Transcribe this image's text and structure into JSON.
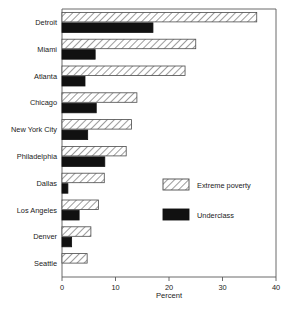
{
  "chart_data": {
    "type": "bar",
    "orientation": "horizontal",
    "title": "",
    "xlabel": "Percent",
    "ylabel": "",
    "xlim": [
      0,
      40
    ],
    "xticks": [
      0,
      10,
      20,
      30,
      40
    ],
    "xtick_labels": [
      "0",
      "10",
      "20",
      "30",
      "40"
    ],
    "grid": false,
    "legend_position": "center-right",
    "categories": [
      "Detroit",
      "Miami",
      "Atlanta",
      "Chicago",
      "New York City",
      "Philadelphia",
      "Dallas",
      "Los Angeles",
      "Denver",
      "Seattle"
    ],
    "series": [
      {
        "name": "Extreme poverty",
        "pattern": "diagonal-hatch",
        "color": "#ffffff",
        "values": [
          36.4,
          25.0,
          23.0,
          14.0,
          13.0,
          12.0,
          7.9,
          6.8,
          5.4,
          4.7
        ]
      },
      {
        "name": "Underclass",
        "pattern": "solid",
        "color": "#111111",
        "values": [
          17.0,
          6.2,
          4.3,
          6.4,
          4.8,
          8.0,
          1.1,
          3.2,
          1.8,
          0.0
        ]
      }
    ]
  },
  "legend": {
    "items": [
      {
        "label": "Extreme poverty"
      },
      {
        "label": "Underclass"
      }
    ]
  },
  "axis": {
    "x_title": "Percent"
  }
}
